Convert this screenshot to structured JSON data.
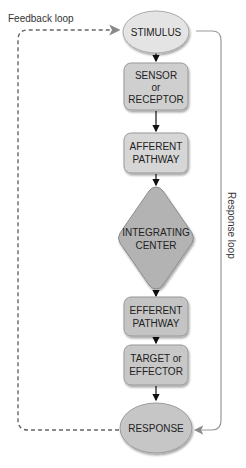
{
  "diagram": {
    "type": "flowchart",
    "nodes": [
      {
        "id": "stimulus",
        "shape": "ellipse",
        "lines": [
          "STIMULUS"
        ],
        "fill": "#e4e4e4"
      },
      {
        "id": "sensor",
        "shape": "rounded-rect",
        "lines": [
          "SENSOR",
          "or",
          "RECEPTOR"
        ],
        "fill": "#cfcfcf"
      },
      {
        "id": "afferent",
        "shape": "rounded-rect",
        "lines": [
          "AFFERENT",
          "PATHWAY"
        ],
        "fill": "#d6d6d6"
      },
      {
        "id": "integrating",
        "shape": "diamond",
        "lines": [
          "INTEGRATING",
          "CENTER"
        ],
        "fill": "#b3b3b3"
      },
      {
        "id": "efferent",
        "shape": "rounded-rect",
        "lines": [
          "EFFERENT",
          "PATHWAY"
        ],
        "fill": "#c4c4c4"
      },
      {
        "id": "target",
        "shape": "rounded-rect",
        "lines": [
          "TARGET or",
          "EFFECTOR"
        ],
        "fill": "#c8c8c8"
      },
      {
        "id": "response",
        "shape": "ellipse",
        "lines": [
          "RESPONSE"
        ],
        "fill": "#c6c6c6"
      }
    ],
    "edges": [
      {
        "from": "stimulus",
        "to": "sensor",
        "style": "solid"
      },
      {
        "from": "sensor",
        "to": "afferent",
        "style": "solid"
      },
      {
        "from": "afferent",
        "to": "integrating",
        "style": "solid"
      },
      {
        "from": "integrating",
        "to": "efferent",
        "style": "solid"
      },
      {
        "from": "efferent",
        "to": "target",
        "style": "solid"
      },
      {
        "from": "target",
        "to": "response",
        "style": "solid"
      },
      {
        "from": "response",
        "to": "stimulus",
        "style": "dashed",
        "label": "Feedback loop"
      },
      {
        "from": "stimulus",
        "to": "response",
        "style": "solid-gray",
        "label": "Response loop"
      }
    ],
    "labels": {
      "feedback_loop": "Feedback loop",
      "response_loop": "Response loop"
    }
  }
}
